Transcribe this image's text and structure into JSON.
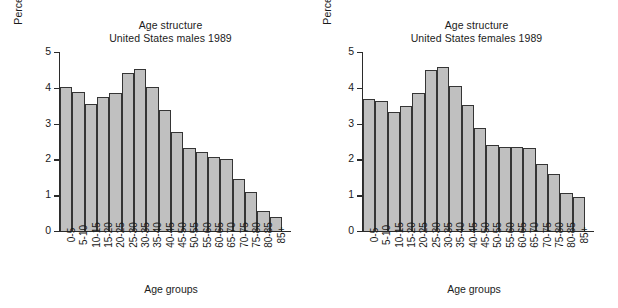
{
  "figure": {
    "background": "#ffffff",
    "bar_fill": "#c0c0c0",
    "bar_edge": "#353535",
    "axis_color": "#2b2b2b"
  },
  "charts": [
    {
      "id": "males",
      "title_line1": "Age structure",
      "title_line2": "United States males 1989",
      "xlabel": "Age groups",
      "ylabel": "Percent of population",
      "ytick_labels": [
        "5",
        "4",
        "3",
        "2",
        "1",
        "0"
      ]
    },
    {
      "id": "females",
      "title_line1": "Age structure",
      "title_line2": "United States females 1989",
      "xlabel": "Age groups",
      "ylabel": "Percent of population",
      "ytick_labels": [
        "5",
        "4",
        "3",
        "2",
        "1",
        "0"
      ]
    }
  ],
  "chart_data": [
    {
      "type": "bar",
      "title": "Age structure United States males 1989",
      "subtitle": "United States males 1989",
      "xlabel": "Age groups",
      "ylabel": "Percent of population",
      "ylim": [
        0,
        5
      ],
      "yticks": [
        0,
        1,
        2,
        3,
        4,
        5
      ],
      "grid": false,
      "legend": null,
      "categories": [
        "0-5",
        "5-10",
        "10-15",
        "15-20",
        "20-25",
        "25-30",
        "30-35",
        "35-40",
        "40-45",
        "45-50",
        "50-55",
        "55-60",
        "60-65",
        "65-70",
        "70-75",
        "75-80",
        "80-85",
        "85+"
      ],
      "values": [
        4.02,
        3.87,
        3.55,
        3.75,
        3.86,
        4.42,
        4.53,
        4.01,
        3.39,
        2.76,
        2.31,
        2.21,
        2.07,
        2.01,
        1.46,
        1.08,
        0.55,
        0.38
      ]
    },
    {
      "type": "bar",
      "title": "Age structure United States females 1989",
      "subtitle": "United States females 1989",
      "xlabel": "Age groups",
      "ylabel": "Percent of population",
      "ylim": [
        0,
        5
      ],
      "yticks": [
        0,
        1,
        2,
        3,
        4,
        5
      ],
      "grid": false,
      "legend": null,
      "categories": [
        "0-5",
        "5-10",
        "10-15",
        "15-20",
        "20-25",
        "25-30",
        "30-35",
        "35-40",
        "40-45",
        "45-50",
        "50-55",
        "55-60",
        "60-65",
        "65-70",
        "70-75",
        "75-80",
        "80-85",
        "85+"
      ],
      "values": [
        3.68,
        3.63,
        3.33,
        3.48,
        3.86,
        4.49,
        4.57,
        4.04,
        3.52,
        2.87,
        2.4,
        2.35,
        2.36,
        2.31,
        1.87,
        1.6,
        1.05,
        0.96
      ]
    }
  ]
}
